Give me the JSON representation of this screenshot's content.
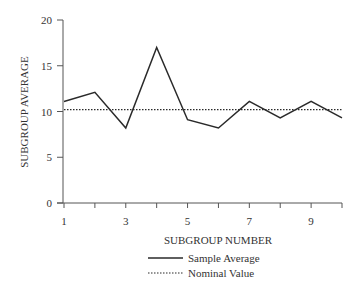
{
  "chart_data": {
    "type": "line",
    "title": "",
    "xlabel": "SUBGROUP NUMBER",
    "ylabel": "SUBGROUP AVERAGE",
    "x": [
      1,
      2,
      3,
      4,
      5,
      6,
      7,
      8,
      9,
      10
    ],
    "x_tick_labels": [
      "1",
      "3",
      "5",
      "7",
      "9"
    ],
    "x_tick_label_values": [
      1,
      3,
      5,
      7,
      9
    ],
    "y_ticks": [
      0,
      5,
      10,
      15,
      20
    ],
    "y_tick_labels": [
      "0",
      "5",
      "10",
      "15",
      "20"
    ],
    "ylim": [
      0,
      20
    ],
    "xlim": [
      1,
      10
    ],
    "grid": false,
    "legend_position": "bottom",
    "series": [
      {
        "name": "Sample Average",
        "style": "solid",
        "values": [
          11.1,
          12.1,
          8.2,
          17.0,
          9.1,
          8.2,
          11.1,
          9.3,
          11.1,
          9.3
        ]
      },
      {
        "name": "Nominal Value",
        "style": "dotted",
        "values": [
          10.2,
          10.2,
          10.2,
          10.2,
          10.2,
          10.2,
          10.2,
          10.2,
          10.2,
          10.2
        ]
      }
    ]
  },
  "legend": {
    "items": [
      {
        "label": "Sample Average",
        "style": "solid"
      },
      {
        "label": "Nominal Value",
        "style": "dotted"
      }
    ]
  },
  "colors": {
    "line": "#2a2a2a",
    "axis": "#555555"
  }
}
